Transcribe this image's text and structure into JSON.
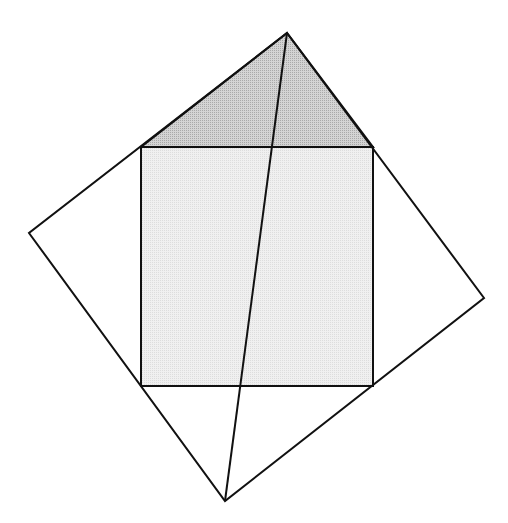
{
  "diagram": {
    "colors": {
      "stroke": "#111111",
      "square_fill": "#ebebeb",
      "triangle_fill": "#c6c6c6",
      "background": "#ffffff"
    },
    "outer_quad": {
      "top": [
        287,
        33
      ],
      "right": [
        484,
        298
      ],
      "bottom": [
        225,
        501
      ],
      "left": [
        29,
        233
      ]
    },
    "inner_square": {
      "top_left": [
        141,
        147
      ],
      "top_right": [
        373,
        147
      ],
      "bottom_right": [
        373,
        386
      ],
      "bottom_left": [
        141,
        386
      ]
    },
    "shaded_triangle": {
      "apex": [
        287,
        33
      ],
      "base_left": [
        141,
        147
      ],
      "base_right": [
        373,
        147
      ]
    },
    "diagonal_line": {
      "from": [
        287,
        33
      ],
      "to": [
        225,
        501
      ]
    }
  }
}
